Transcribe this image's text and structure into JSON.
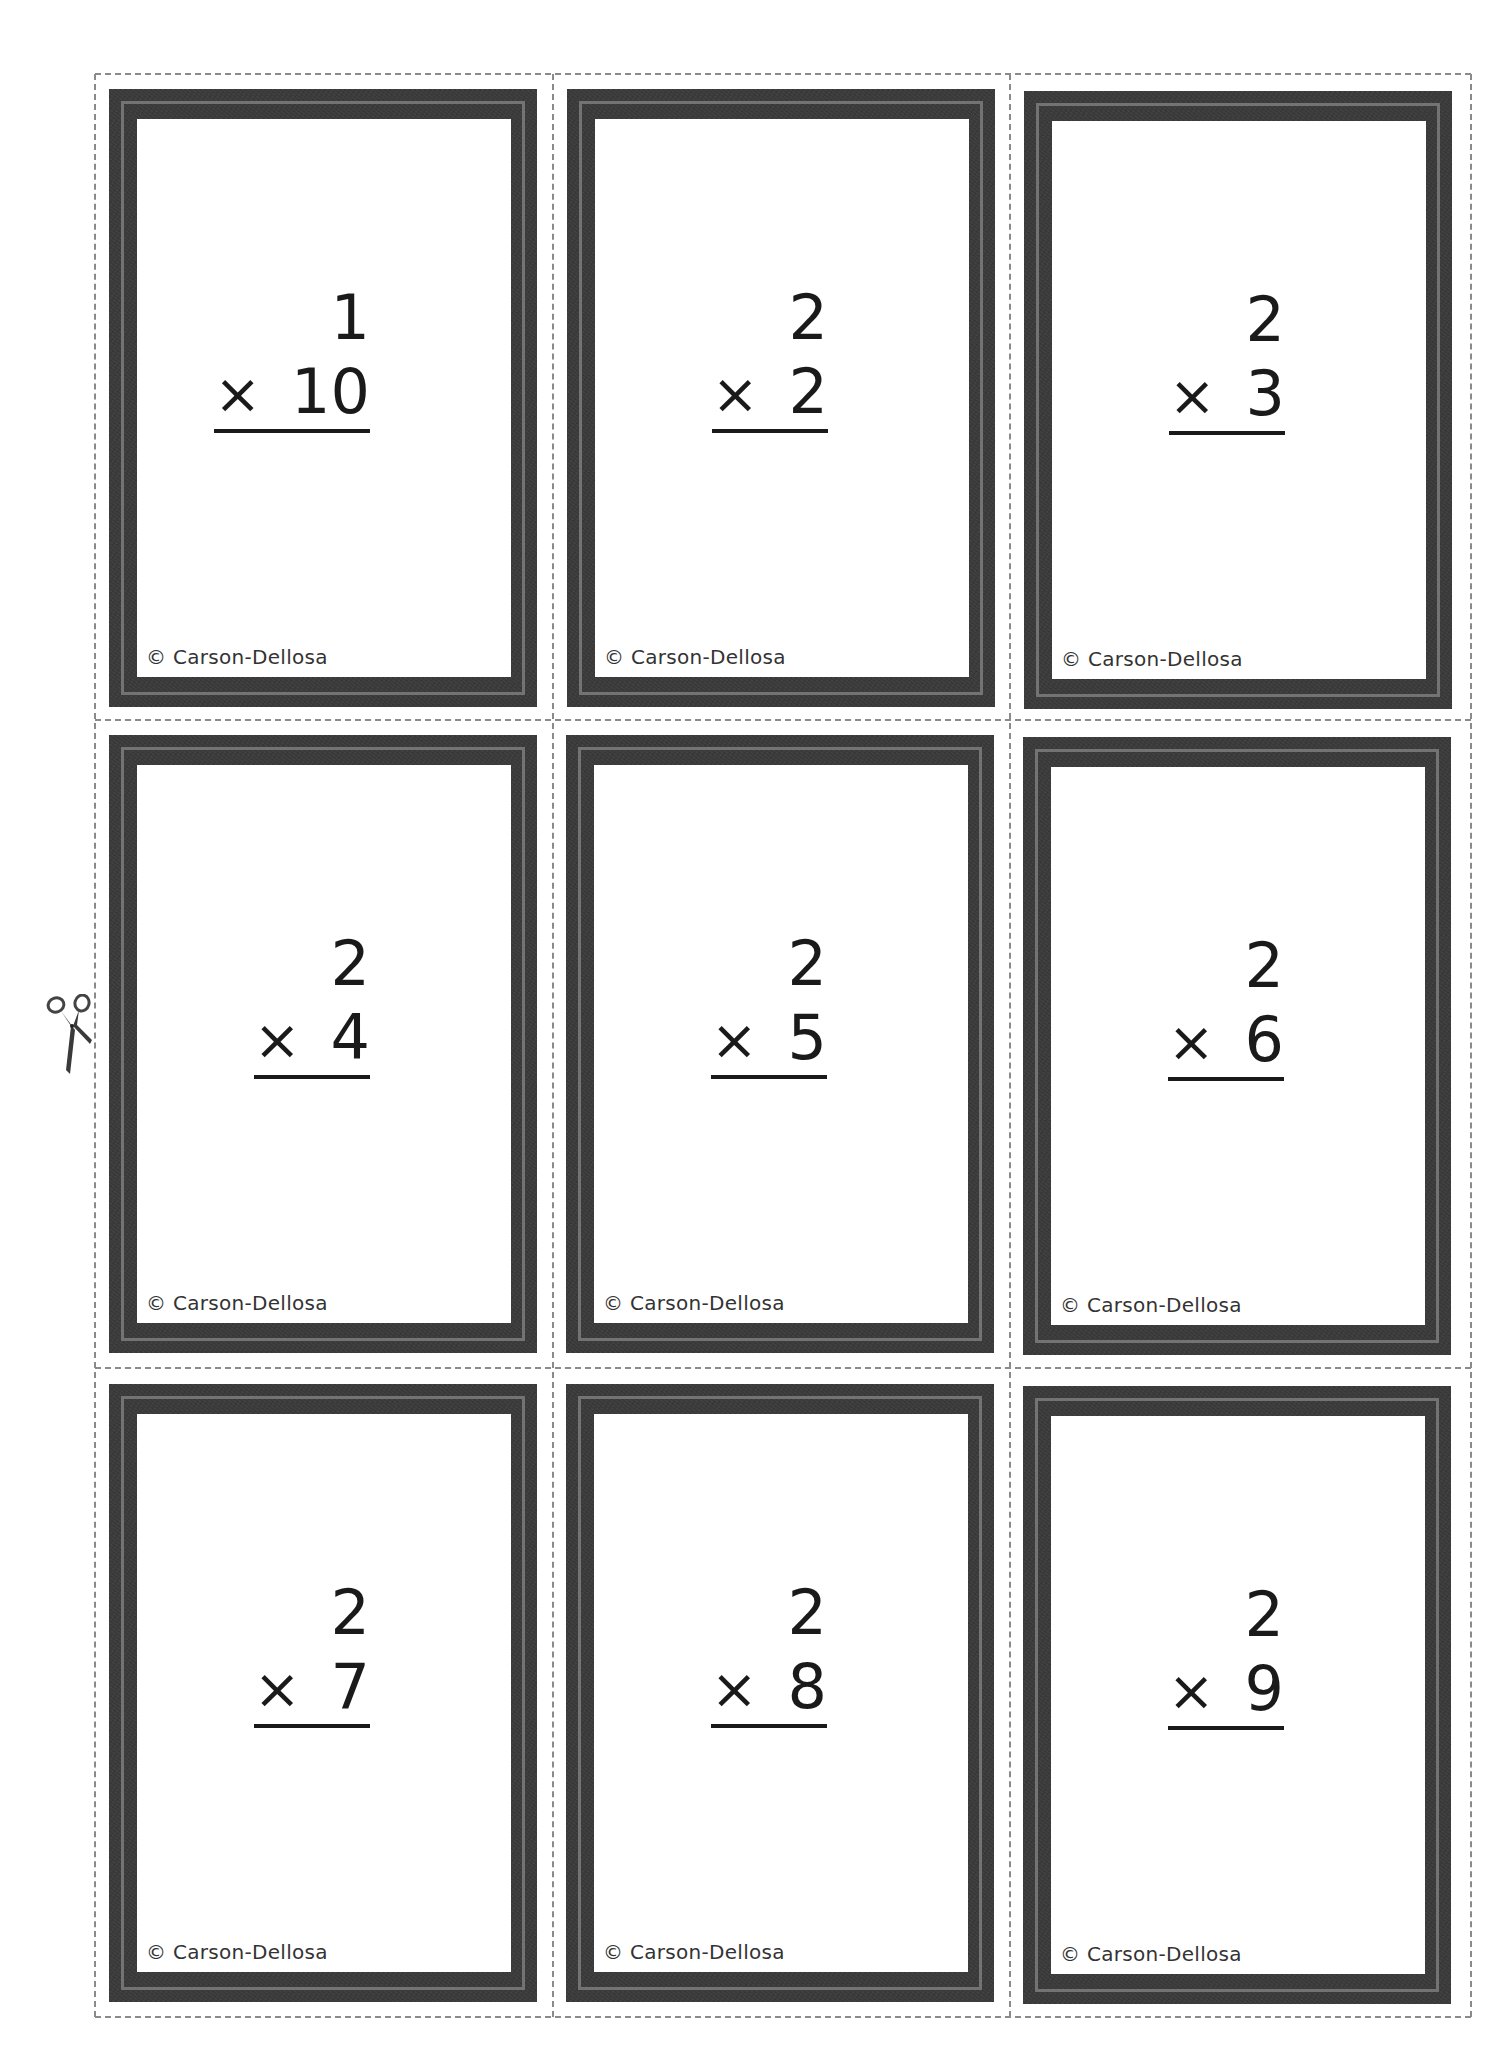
{
  "sheet": {
    "title": "Multiplication flash cards",
    "cut_line_color": "#8a8a8a",
    "frame_color": "#3b3b3b",
    "frame_stripe_color": "#737373",
    "scissors_icon": "scissors-icon"
  },
  "cards": [
    {
      "top": "1",
      "operator": "×",
      "bottom": "10",
      "copyright": "© Carson-Dellosa"
    },
    {
      "top": "2",
      "operator": "×",
      "bottom": "2",
      "copyright": "© Carson-Dellosa"
    },
    {
      "top": "2",
      "operator": "×",
      "bottom": "3",
      "copyright": "© Carson-Dellosa"
    },
    {
      "top": "2",
      "operator": "×",
      "bottom": "4",
      "copyright": "© Carson-Dellosa"
    },
    {
      "top": "2",
      "operator": "×",
      "bottom": "5",
      "copyright": "© Carson-Dellosa"
    },
    {
      "top": "2",
      "operator": "×",
      "bottom": "6",
      "copyright": "© Carson-Dellosa"
    },
    {
      "top": "2",
      "operator": "×",
      "bottom": "7",
      "copyright": "© Carson-Dellosa"
    },
    {
      "top": "2",
      "operator": "×",
      "bottom": "8",
      "copyright": "© Carson-Dellosa"
    },
    {
      "top": "2",
      "operator": "×",
      "bottom": "9",
      "copyright": "© Carson-Dellosa"
    }
  ]
}
